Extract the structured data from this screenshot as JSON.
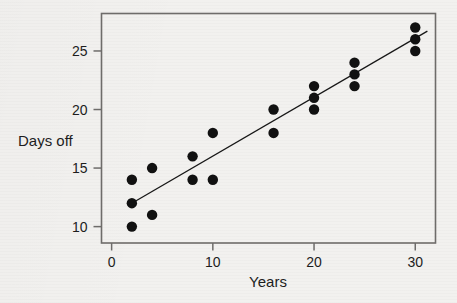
{
  "chart_data": {
    "type": "scatter",
    "title": "",
    "xlabel": "Years",
    "ylabel": "Days off",
    "xlim": [
      -1.0,
      32.0
    ],
    "ylim": [
      8.6,
      28.2
    ],
    "xticks": [
      0,
      10,
      20,
      30
    ],
    "yticks": [
      10,
      15,
      20,
      25
    ],
    "xtick_labels": [
      "0",
      "10",
      "20",
      "30"
    ],
    "ytick_labels": [
      "10",
      "15",
      "20",
      "25"
    ],
    "grid": false,
    "legend": null,
    "frame": true,
    "marker": {
      "shape": "circle",
      "color": "#111111",
      "size": 5.2
    },
    "points": [
      {
        "x": 2,
        "y": 14
      },
      {
        "x": 2,
        "y": 12
      },
      {
        "x": 2,
        "y": 10
      },
      {
        "x": 4,
        "y": 15
      },
      {
        "x": 4,
        "y": 11
      },
      {
        "x": 8,
        "y": 16
      },
      {
        "x": 8,
        "y": 14
      },
      {
        "x": 10,
        "y": 18
      },
      {
        "x": 10,
        "y": 14
      },
      {
        "x": 16,
        "y": 20
      },
      {
        "x": 16,
        "y": 18
      },
      {
        "x": 20,
        "y": 22
      },
      {
        "x": 20,
        "y": 21
      },
      {
        "x": 20,
        "y": 20
      },
      {
        "x": 24,
        "y": 24
      },
      {
        "x": 24,
        "y": 23
      },
      {
        "x": 24,
        "y": 22
      },
      {
        "x": 30,
        "y": 27
      },
      {
        "x": 30,
        "y": 26
      },
      {
        "x": 30,
        "y": 25
      }
    ],
    "x_values": [
      2,
      2,
      2,
      4,
      4,
      8,
      8,
      10,
      10,
      16,
      16,
      20,
      20,
      20,
      24,
      24,
      24,
      30,
      30,
      30
    ],
    "y_values": [
      14,
      12,
      10,
      15,
      11,
      16,
      14,
      18,
      14,
      20,
      18,
      22,
      21,
      20,
      24,
      23,
      22,
      27,
      26,
      25
    ],
    "fit_line": {
      "type": "linear",
      "color": "#171717",
      "x_start": 2.0,
      "y_start": 12.0,
      "x_end": 31.2,
      "y_end": 26.7,
      "slope": 0.503,
      "intercept": 10.99
    }
  },
  "background": {
    "ghost_text_lines": [
      "",
      "",
      "",
      "",
      ""
    ]
  },
  "colors": {
    "page": "#f2f1ef",
    "axis": "#6e6c6a",
    "text": "#1d1d1d",
    "marker": "#111111",
    "line": "#171717"
  }
}
